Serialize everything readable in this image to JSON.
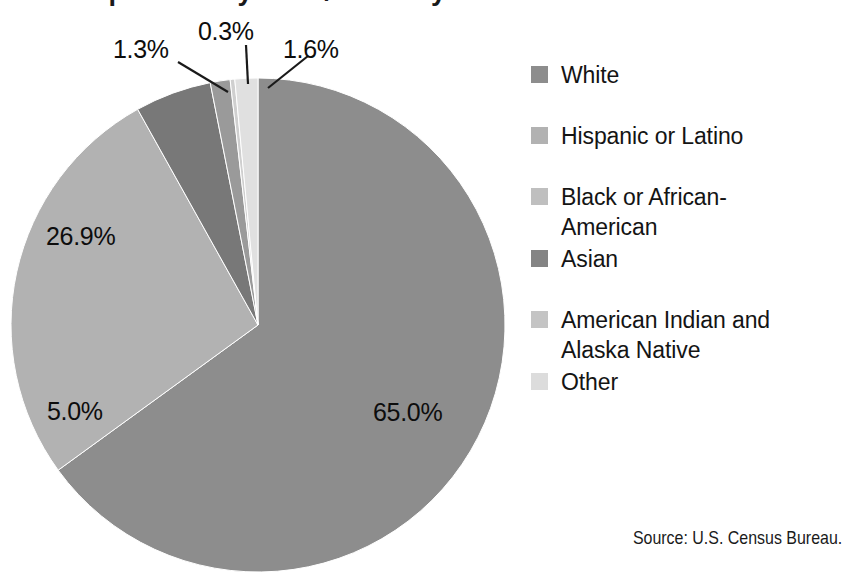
{
  "chart_data": {
    "type": "pie",
    "title": "Population by Race/Ethnicity",
    "subtitle": "",
    "xlabel": "",
    "ylabel": "",
    "legend_position": "right",
    "grid": false,
    "start_angle_deg": 0,
    "direction": "clockwise",
    "categories": [
      "White",
      "Hispanic or Latino",
      "Black or African-American",
      "Asian",
      "American Indian and Alaska Native",
      "Other"
    ],
    "values": [
      65.0,
      26.9,
      5.0,
      1.3,
      0.3,
      1.6
    ],
    "value_labels": [
      "65.0%",
      "26.9%",
      "5.0%",
      "1.3%",
      "0.3%",
      "1.6%"
    ],
    "colors": [
      "#8d8d8d",
      "#b2b2b2",
      "#787878",
      "#9a9a9a",
      "#cfcfcf",
      "#e0e0e0"
    ],
    "units": "percent",
    "total": 100.1,
    "annotations": [
      "Source: U.S. Census Bureau."
    ]
  },
  "title": {
    "text": "Population by Race/Ethnicity"
  },
  "slices": [
    {
      "name": "White",
      "label": "65.0%",
      "value": 65.0,
      "color": "#8d8d8d",
      "start_deg": 0,
      "sweep_deg": 234.0,
      "leader": false
    },
    {
      "name": "Hispanic or Latino",
      "label": "26.9%",
      "value": 26.9,
      "color": "#b2b2b2",
      "start_deg": 234.0,
      "sweep_deg": 96.84,
      "leader": false
    },
    {
      "name": "Black or African-American",
      "label": "5.0%",
      "value": 5.0,
      "color": "#787878",
      "start_deg": 330.84,
      "sweep_deg": 18.0,
      "leader": false
    },
    {
      "name": "Asian",
      "label": "1.3%",
      "value": 1.3,
      "color": "#9a9a9a",
      "start_deg": 348.84,
      "sweep_deg": 4.68,
      "leader": true
    },
    {
      "name": "American Indian and Alaska Native",
      "label": "0.3%",
      "value": 0.3,
      "color": "#cfcfcf",
      "start_deg": 353.52,
      "sweep_deg": 1.08,
      "leader": true
    },
    {
      "name": "Other",
      "label": "1.6%",
      "value": 1.6,
      "color": "#e0e0e0",
      "start_deg": 354.6,
      "sweep_deg": 5.4,
      "leader": true
    }
  ],
  "legend": {
    "items": [
      {
        "label": "White",
        "color": "#8d8d8d"
      },
      {
        "label": "Hispanic or Latino",
        "color": "#b2b2b2"
      },
      {
        "label": "Black or African-American",
        "color": "#bfbfbf"
      },
      {
        "label": "Asian",
        "color": "#848484"
      },
      {
        "label": "American Indian and Alaska Native",
        "color": "#c4c4c4"
      },
      {
        "label": "Other",
        "color": "#dcdcdc"
      }
    ]
  },
  "source": {
    "text": "Source: U.S. Census Bureau."
  }
}
